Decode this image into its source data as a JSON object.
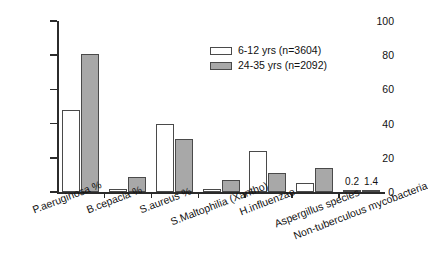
{
  "chart_data": {
    "type": "bar",
    "title": "",
    "xlabel": "",
    "ylabel": "",
    "ylim": [
      0,
      100
    ],
    "yticks": [
      0,
      20,
      40,
      60,
      80,
      100
    ],
    "grid": false,
    "legend_position": "upper-center-right",
    "categories": [
      "P.aeruginosa %",
      "B.cepacia %",
      "S.aureus %",
      "S.Maltophilia (Xantho)",
      "H.influenzae",
      "Aspergillus species",
      "Non-tuberculous mycobacteria"
    ],
    "series": [
      {
        "name": "6-12 yrs (n=3604)",
        "values": [
          48,
          2,
          40,
          2,
          24,
          5,
          0.2
        ],
        "color": "#ffffff"
      },
      {
        "name": "24-35 yrs (n=2092)",
        "values": [
          81,
          9,
          31,
          7,
          11,
          14,
          1.4
        ],
        "color": "#a8a8a8"
      }
    ],
    "point_labels": [
      {
        "text": "0.2",
        "category_index": 6,
        "series_index": 0
      },
      {
        "text": "1.4",
        "category_index": 6,
        "series_index": 1
      }
    ]
  },
  "legend": {
    "items": [
      {
        "label": "6-12 yrs (n=3604)",
        "swatch": "light"
      },
      {
        "label": "24-35 yrs (n=2092)",
        "swatch": "dark"
      }
    ]
  },
  "axis": {
    "y_tick_labels": [
      "100",
      "80",
      "60",
      "40",
      "20",
      "0"
    ]
  }
}
